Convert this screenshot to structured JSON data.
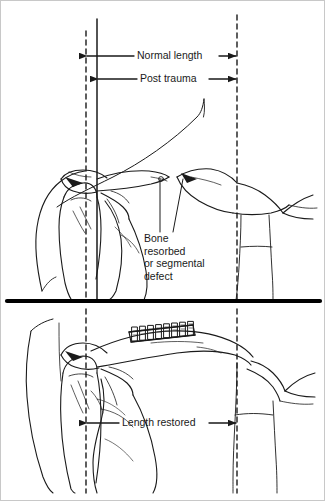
{
  "figure": {
    "panels": [
      {
        "id": "top",
        "name": "post-trauma",
        "labels": [
          {
            "key": "normal_length",
            "text": "Normal length"
          },
          {
            "key": "post_trauma",
            "text": "Post trauma"
          },
          {
            "key": "defect",
            "text": "Bone resorbed or segmental defect"
          }
        ]
      },
      {
        "id": "bottom",
        "name": "reconstructed",
        "labels": [
          {
            "key": "length_restored",
            "text": "Length restored"
          }
        ]
      }
    ]
  },
  "annotations": {
    "normal_length": "Normal length",
    "post_trauma": "Post trauma",
    "defect_line1": "Bone",
    "defect_line2": "resorbed",
    "defect_line3": "or segmental",
    "defect_line4": "defect",
    "length_restored": "Length restored"
  },
  "hardware": {
    "plate_label": "bone plate",
    "screw_count": 8
  },
  "colors": {
    "ink": "#111111",
    "line": "#1a1a1a",
    "background": "#ffffff",
    "divider": "#000000",
    "border": "#c8c8c8"
  },
  "geometry": {
    "width": 325,
    "height": 501,
    "reference_line_left_x": 85,
    "reference_line_mid_x": 96,
    "reference_line_right_x": 236,
    "divider_y": 300
  }
}
